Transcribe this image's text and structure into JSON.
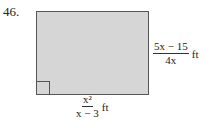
{
  "problem": {
    "number": "46.",
    "right_label": {
      "numerator": "5x − 15",
      "denominator": "4x",
      "unit": "ft"
    },
    "bottom_label": {
      "numerator": "x²",
      "denominator": "x − 3",
      "unit": "ft"
    }
  }
}
